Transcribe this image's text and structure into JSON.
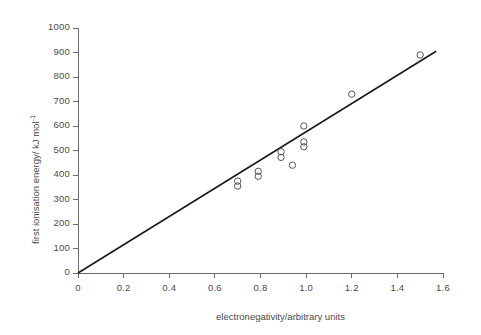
{
  "chart_data": {
    "type": "scatter",
    "title": "",
    "xlabel": "electronegativity/arbitrary units",
    "ylabel": "first ionisation energy/ kJ mol",
    "ylabel_exponent": "-1",
    "xlim": [
      0,
      1.6
    ],
    "ylim": [
      0,
      1000
    ],
    "xticks": [
      "0",
      "0.2",
      "0.4",
      "0.6",
      "0.8",
      "1.0",
      "1.2",
      "1.4",
      "1.6"
    ],
    "xtick_values": [
      0,
      0.2,
      0.4,
      0.6,
      0.8,
      1.0,
      1.2,
      1.4,
      1.6
    ],
    "yticks": [
      "0",
      "100",
      "200",
      "300",
      "400",
      "500",
      "600",
      "700",
      "800",
      "900",
      "1000"
    ],
    "ytick_values": [
      0,
      100,
      200,
      300,
      400,
      500,
      600,
      700,
      800,
      900,
      1000
    ],
    "grid": false,
    "legend": null,
    "marker": "open-circle",
    "marker_color": "#555555",
    "points": [
      {
        "x": 0.7,
        "y": 375
      },
      {
        "x": 0.7,
        "y": 355
      },
      {
        "x": 0.79,
        "y": 415
      },
      {
        "x": 0.79,
        "y": 395
      },
      {
        "x": 0.89,
        "y": 495
      },
      {
        "x": 0.89,
        "y": 472
      },
      {
        "x": 0.99,
        "y": 600
      },
      {
        "x": 0.99,
        "y": 535
      },
      {
        "x": 0.99,
        "y": 515
      },
      {
        "x": 0.94,
        "y": 440
      },
      {
        "x": 1.2,
        "y": 730
      },
      {
        "x": 1.5,
        "y": 890
      }
    ],
    "trendline": {
      "x_start": 0.0,
      "y_start": 0,
      "x_end": 1.57,
      "y_end": 905,
      "color": "#1a1a1a",
      "width": 1.6
    },
    "axis_color": "#6a6a6a"
  }
}
